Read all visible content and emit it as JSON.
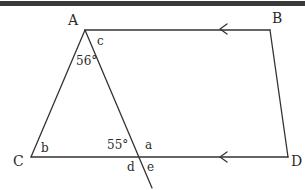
{
  "figure": {
    "background_color": "#ffffff",
    "stroke_color": "#333333",
    "top_band_color": "#3a3a3a",
    "vertices": {
      "A": {
        "label": "A",
        "x": 85,
        "y": 30,
        "label_x": 68,
        "label_y": 13
      },
      "B": {
        "label": "B",
        "x": 270,
        "y": 30,
        "label_x": 272,
        "label_y": 11
      },
      "C": {
        "label": "C",
        "x": 31,
        "y": 157,
        "label_x": 13,
        "label_y": 154
      },
      "D": {
        "label": "D",
        "x": 288,
        "y": 157,
        "label_x": 291,
        "label_y": 154
      },
      "X": {
        "label": "",
        "x": 137,
        "y": 157,
        "label_x": 0,
        "label_y": 0
      }
    },
    "transversal_end": {
      "x": 152,
      "y": 188
    },
    "angle_labels": [
      {
        "name": "angle-at-a-56",
        "text": "56°",
        "x": 76,
        "y": 55
      },
      {
        "name": "angle-at-x-55",
        "text": "55°",
        "x": 107,
        "y": 139
      }
    ],
    "variable_labels": [
      {
        "name": "angle-c",
        "text": "c",
        "x": 97,
        "y": 35
      },
      {
        "name": "angle-b",
        "text": "b",
        "x": 41,
        "y": 142
      },
      {
        "name": "angle-a",
        "text": "a",
        "x": 145,
        "y": 139
      },
      {
        "name": "angle-d",
        "text": "d",
        "x": 127,
        "y": 161
      },
      {
        "name": "angle-e",
        "text": "e",
        "x": 147,
        "y": 161
      }
    ],
    "parallel_marks": [
      {
        "name": "parallel-mark-ab",
        "x": 222,
        "y": 29,
        "direction": "left"
      },
      {
        "name": "parallel-mark-cd",
        "x": 222,
        "y": 157,
        "direction": "left"
      }
    ]
  }
}
